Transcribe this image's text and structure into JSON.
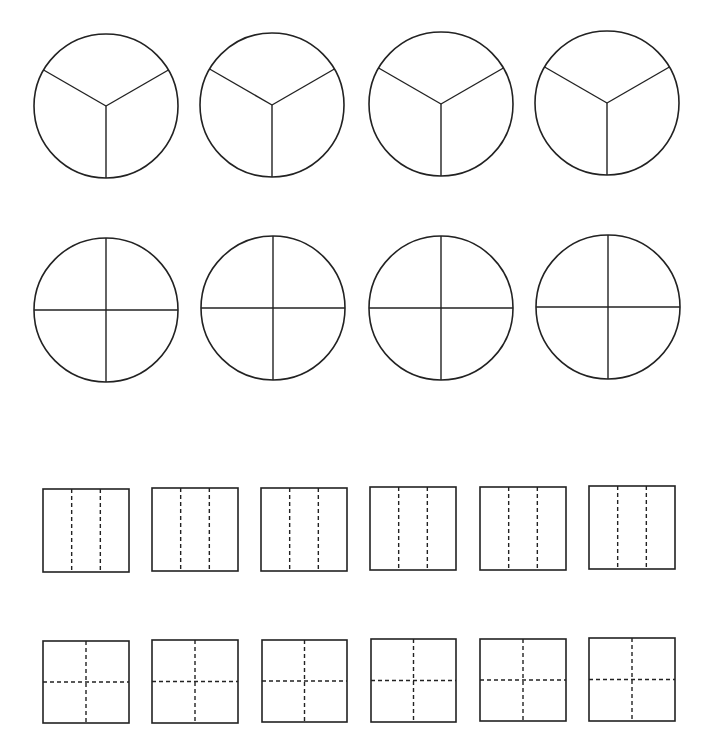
{
  "worksheet": {
    "background": "#ffffff",
    "stroke_color": "#222222",
    "rows": [
      {
        "name": "circles-thirds",
        "shape": "circle",
        "divisions": 3,
        "line_style": "solid",
        "items": [
          {
            "cx": 106,
            "cy": 106,
            "r": 72
          },
          {
            "cx": 272,
            "cy": 105,
            "r": 72
          },
          {
            "cx": 441,
            "cy": 104,
            "r": 72
          },
          {
            "cx": 607,
            "cy": 103,
            "r": 72
          }
        ]
      },
      {
        "name": "circles-quarters",
        "shape": "circle",
        "divisions": 4,
        "line_style": "solid",
        "items": [
          {
            "cx": 106,
            "cy": 310,
            "r": 72
          },
          {
            "cx": 273,
            "cy": 308,
            "r": 72
          },
          {
            "cx": 441,
            "cy": 308,
            "r": 72
          },
          {
            "cx": 608,
            "cy": 307,
            "r": 72
          }
        ]
      },
      {
        "name": "squares-thirds",
        "shape": "square",
        "divisions": 3,
        "line_style": "dashed",
        "orientation": "vertical",
        "items": [
          {
            "x": 43,
            "y": 489,
            "w": 86,
            "h": 83
          },
          {
            "x": 152,
            "y": 488,
            "w": 86,
            "h": 83
          },
          {
            "x": 261,
            "y": 488,
            "w": 86,
            "h": 83
          },
          {
            "x": 370,
            "y": 487,
            "w": 86,
            "h": 83
          },
          {
            "x": 480,
            "y": 487,
            "w": 86,
            "h": 83
          },
          {
            "x": 589,
            "y": 486,
            "w": 86,
            "h": 83
          }
        ]
      },
      {
        "name": "squares-quarters",
        "shape": "square",
        "divisions": 4,
        "line_style": "dashed",
        "orientation": "grid",
        "items": [
          {
            "x": 43,
            "y": 641,
            "w": 86,
            "h": 82
          },
          {
            "x": 152,
            "y": 640,
            "w": 86,
            "h": 83
          },
          {
            "x": 262,
            "y": 640,
            "w": 85,
            "h": 82
          },
          {
            "x": 371,
            "y": 639,
            "w": 85,
            "h": 83
          },
          {
            "x": 480,
            "y": 639,
            "w": 86,
            "h": 82
          },
          {
            "x": 589,
            "y": 638,
            "w": 86,
            "h": 83
          }
        ]
      }
    ]
  }
}
